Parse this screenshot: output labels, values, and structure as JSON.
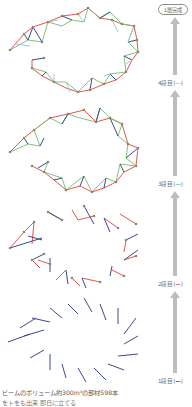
{
  "diagram": {
    "completion_label": "1層完成",
    "stages": [
      {
        "label_prefix": "4段目",
        "dash": "—",
        "color": "#9ec9e0",
        "paren_open": "(",
        "paren_close": ")"
      },
      {
        "label_prefix": "3段目",
        "dash": "—",
        "color": "#7fc47a",
        "paren_open": "(",
        "paren_close": ")"
      },
      {
        "label_prefix": "2段目",
        "dash": "—",
        "color": "#e2574c",
        "paren_open": "(",
        "paren_close": ")"
      },
      {
        "label_prefix": "1段目",
        "dash": "—",
        "color": "#3d4a8a",
        "paren_open": "(",
        "paren_close": ")"
      }
    ],
    "beam_colors": {
      "day1": "#3d4a8a",
      "day2": "#e2574c",
      "day3": "#7fc47a",
      "day4": "#9ec9e0",
      "joint": "#8a8a6a"
    },
    "arrow_color": "#bdbdbd",
    "caption": "ビームのボリューム約300m³の部材598本",
    "caption_line2": "をトをも出来 即日に立てる"
  }
}
